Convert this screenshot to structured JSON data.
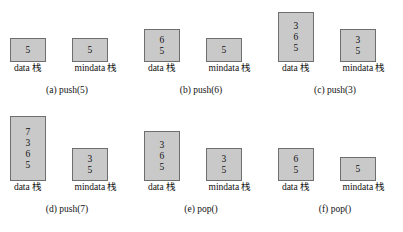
{
  "figure": {
    "type": "diagram",
    "box_fill_color": "#c9c9c9",
    "box_border_color": "#6e6e6e",
    "background_color": "#ffffff"
  },
  "labels": {
    "data_stack": "data 栈",
    "mindata_stack": "mindata 栈"
  },
  "panels": [
    {
      "id": "a",
      "caption": "(a) push(5)",
      "data_stack": [
        "5"
      ],
      "mindata_stack": [
        "5"
      ]
    },
    {
      "id": "b",
      "caption": "(b) push(6)",
      "data_stack": [
        "6",
        "5"
      ],
      "mindata_stack": [
        "5"
      ]
    },
    {
      "id": "c",
      "caption": "(c) push(3)",
      "data_stack": [
        "3",
        "6",
        "5"
      ],
      "mindata_stack": [
        "3",
        "5"
      ]
    },
    {
      "id": "d",
      "caption": "(d) push(7)",
      "data_stack": [
        "7",
        "3",
        "6",
        "5"
      ],
      "mindata_stack": [
        "3",
        "5"
      ]
    },
    {
      "id": "e",
      "caption": "(e) pop()",
      "data_stack": [
        "3",
        "6",
        "5"
      ],
      "mindata_stack": [
        "3",
        "5"
      ]
    },
    {
      "id": "f",
      "caption": "(f) pop()",
      "data_stack": [
        "6",
        "5"
      ],
      "mindata_stack": [
        "5"
      ]
    }
  ]
}
